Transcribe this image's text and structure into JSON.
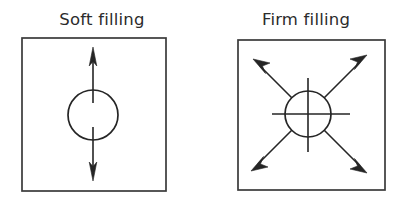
{
  "figure": {
    "width": 408,
    "height": 209,
    "background_color": "#ffffff",
    "line_color": "#252525",
    "box_stroke_color": "#3a3a3a",
    "title_color": "#2b2b2b"
  },
  "panels": [
    {
      "id": "soft",
      "title": "Soft filling",
      "box": {
        "x": 22,
        "y": 38,
        "width": 144,
        "height": 153
      },
      "circle": {
        "cx": 93,
        "cy": 115,
        "r": 25
      },
      "arrows": [
        {
          "name": "vertical-double-arrow",
          "direction": "vertical",
          "from_y": 48,
          "to_y": 180,
          "gap_inside_circle": true
        }
      ],
      "crosshair": false,
      "arrow_count": 1
    },
    {
      "id": "firm",
      "title": "Firm filling",
      "box": {
        "x": 238,
        "y": 40,
        "width": 147,
        "height": 150
      },
      "circle": {
        "cx": 308,
        "cy": 114,
        "r": 23
      },
      "arrows": [
        {
          "name": "diagonal-arrow-up-left",
          "direction": "up-left"
        },
        {
          "name": "diagonal-arrow-up-right",
          "direction": "up-right"
        },
        {
          "name": "diagonal-arrow-down-left",
          "direction": "down-left"
        },
        {
          "name": "diagonal-arrow-down-right",
          "direction": "down-right"
        }
      ],
      "crosshair": true,
      "crosshair_horizontal": {
        "x1": 272,
        "x2": 350,
        "y": 114
      },
      "crosshair_vertical": {
        "y1": 78,
        "y2": 152,
        "x": 308
      },
      "arrow_count": 4
    }
  ]
}
